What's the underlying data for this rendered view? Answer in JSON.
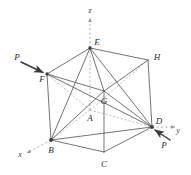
{
  "figure": {
    "background_color": "#ffffff",
    "line_color": "#555555",
    "dashed_color": "#999999",
    "label_color": "#2b2b2b",
    "vertex_labels": [
      {
        "name": "E",
        "text": "E",
        "x": 97,
        "y": 42
      },
      {
        "name": "H",
        "text": "H",
        "x": 157,
        "y": 57
      },
      {
        "name": "F",
        "text": "F",
        "x": 42,
        "y": 79
      },
      {
        "name": "G",
        "text": "G",
        "x": 104,
        "y": 101
      },
      {
        "name": "A",
        "text": "A",
        "x": 90,
        "y": 118
      },
      {
        "name": "D",
        "text": "D",
        "x": 159,
        "y": 121
      },
      {
        "name": "B",
        "text": "B",
        "x": 51,
        "y": 150
      },
      {
        "name": "C",
        "text": "C",
        "x": 104,
        "y": 164
      }
    ],
    "axis_labels": [
      {
        "name": "z",
        "text": "z",
        "x": 90,
        "y": 11
      },
      {
        "name": "y",
        "text": "y",
        "x": 178,
        "y": 131
      },
      {
        "name": "x",
        "text": "x",
        "x": 20,
        "y": 155
      }
    ],
    "force_labels": [
      {
        "name": "P-left",
        "text": "P",
        "x": 17,
        "y": 57
      },
      {
        "name": "P-right",
        "text": "P",
        "x": 164,
        "y": 145
      }
    ]
  },
  "geometry": {
    "vertices": {
      "E": {
        "x": 90,
        "y": 48
      },
      "H": {
        "x": 148,
        "y": 60
      },
      "F": {
        "x": 47,
        "y": 74
      },
      "G": {
        "x": 104,
        "y": 91
      },
      "A": {
        "x": 90,
        "y": 110
      },
      "D": {
        "x": 152,
        "y": 127
      },
      "B": {
        "x": 51,
        "y": 140
      },
      "C": {
        "x": 104,
        "y": 152
      }
    },
    "solid_edges": [
      [
        "E",
        "H"
      ],
      [
        "E",
        "F"
      ],
      [
        "E",
        "G"
      ],
      [
        "E",
        "B"
      ],
      [
        "E",
        "D"
      ],
      [
        "F",
        "G"
      ],
      [
        "F",
        "B"
      ],
      [
        "F",
        "D"
      ],
      [
        "H",
        "G"
      ],
      [
        "H",
        "D"
      ],
      [
        "G",
        "B"
      ],
      [
        "G",
        "C"
      ],
      [
        "G",
        "D"
      ],
      [
        "B",
        "C"
      ],
      [
        "B",
        "D"
      ],
      [
        "C",
        "D"
      ]
    ],
    "dashed_edges": [
      [
        "A",
        "E"
      ],
      [
        "A",
        "F"
      ],
      [
        "A",
        "B"
      ],
      [
        "A",
        "D"
      ],
      [
        "A",
        "H"
      ]
    ],
    "axes": {
      "z": {
        "from": {
          "x": 90,
          "y": 17
        },
        "to": {
          "x": 90,
          "y": 48
        }
      },
      "y": {
        "from": {
          "x": 152,
          "y": 127
        },
        "to": {
          "x": 176,
          "y": 127
        }
      },
      "x": {
        "from": {
          "x": 26,
          "y": 153
        },
        "to": {
          "x": 51,
          "y": 140
        }
      }
    },
    "force_arrows": [
      {
        "name": "P-at-F",
        "from": {
          "x": 21,
          "y": 62
        },
        "to": {
          "x": 46,
          "y": 74
        }
      },
      {
        "name": "P-at-D",
        "from": {
          "x": 170,
          "y": 140
        },
        "to": {
          "x": 152,
          "y": 128
        }
      }
    ]
  }
}
